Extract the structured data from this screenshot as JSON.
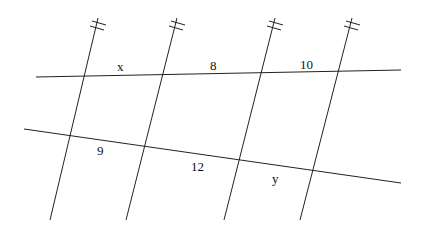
{
  "diagram": {
    "type": "parallel-lines-transversals",
    "stroke_color": "#222222",
    "background": "#ffffff",
    "parallel_lines": [
      {
        "x1": 98,
        "y1": 18,
        "x2": 50,
        "y2": 220
      },
      {
        "x1": 177,
        "y1": 18,
        "x2": 126,
        "y2": 220
      },
      {
        "x1": 275,
        "y1": 18,
        "x2": 224,
        "y2": 220
      },
      {
        "x1": 352,
        "y1": 18,
        "x2": 300,
        "y2": 220
      }
    ],
    "transversals": [
      {
        "x1": 36,
        "y1": 77,
        "x2": 401,
        "y2": 70
      },
      {
        "x1": 24,
        "y1": 129,
        "x2": 401,
        "y2": 183
      }
    ],
    "labels": {
      "x": {
        "text": "x",
        "x": 121,
        "y": 70
      },
      "eight": {
        "text": "8",
        "x": 213,
        "y": 70
      },
      "ten": {
        "text": "10",
        "x": 301,
        "y": 69
      },
      "nine": {
        "text": "9",
        "x": 101,
        "y": 155
      },
      "twelve": {
        "text": "12",
        "x": 196,
        "y": 171
      },
      "y": {
        "text": "y",
        "x": 275,
        "y": 183
      }
    }
  }
}
